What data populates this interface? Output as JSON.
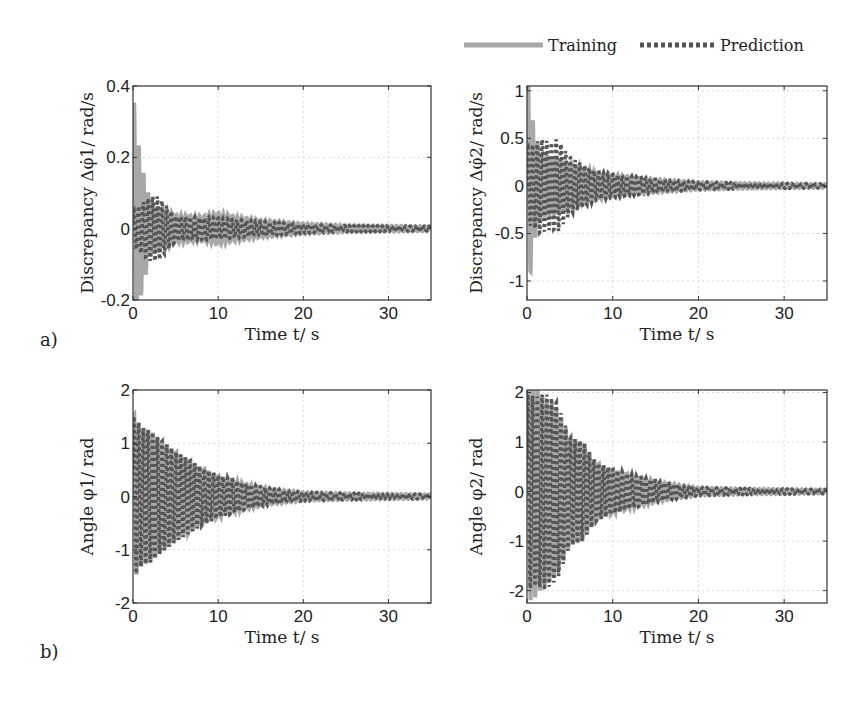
{
  "legend": {
    "items": [
      {
        "name": "Training",
        "style": "solid",
        "color": "#a8a8a8"
      },
      {
        "name": "Prediction",
        "style": "dotted",
        "color": "#555555"
      }
    ]
  },
  "panels": [
    {
      "label": "a)"
    },
    {
      "label": "b)"
    }
  ],
  "chart_data": [
    {
      "type": "line",
      "id": "top-left",
      "panel": "a)",
      "title": "",
      "xlabel": "Time t/ s",
      "ylabel": "Discrepancy Δφ̇1/ rad/s",
      "xlim": [
        0,
        35
      ],
      "ylim": [
        -0.2,
        0.4
      ],
      "xticks": [
        0,
        10,
        20,
        30
      ],
      "yticks": [
        -0.2,
        0,
        0.2,
        0.4
      ],
      "ytick_labels": [
        "-0.2",
        "0",
        "0.2",
        "0.4"
      ],
      "grid": true,
      "series": [
        {
          "name": "Training",
          "envelope": {
            "t": [
              0,
              0.3,
              1,
              2,
              3,
              5,
              8,
              10,
              12,
              15,
              20,
              25,
              35
            ],
            "amp": [
              0.4,
              0.3,
              0.18,
              0.08,
              0.06,
              0.04,
              0.035,
              0.045,
              0.035,
              0.025,
              0.015,
              0.01,
              0.007
            ]
          }
        },
        {
          "name": "Prediction",
          "envelope": {
            "t": [
              0,
              1,
              2,
              3,
              5,
              8,
              10,
              12,
              15,
              20,
              25,
              35
            ],
            "amp": [
              0.05,
              0.07,
              0.09,
              0.09,
              0.035,
              0.03,
              0.03,
              0.025,
              0.02,
              0.012,
              0.008,
              0.006
            ]
          }
        }
      ]
    },
    {
      "type": "line",
      "id": "top-right",
      "panel": "a)",
      "title": "",
      "xlabel": "Time t/ s",
      "ylabel": "Discrepancy Δφ̇2/ rad/s",
      "xlim": [
        0,
        35
      ],
      "ylim": [
        -1.2,
        1.05
      ],
      "xticks": [
        0,
        10,
        20,
        30
      ],
      "yticks": [
        -1,
        -0.5,
        0,
        0.5,
        1
      ],
      "ytick_labels": [
        "-1",
        "-0.5",
        "0",
        "0.5",
        "1"
      ],
      "grid": true,
      "series": [
        {
          "name": "Training",
          "envelope": {
            "t": [
              0,
              0.3,
              0.8,
              1.5,
              3,
              5,
              8,
              10,
              15,
              20,
              25,
              35
            ],
            "amp": [
              1.2,
              1.0,
              0.6,
              0.35,
              0.3,
              0.25,
              0.15,
              0.12,
              0.07,
              0.04,
              0.03,
              0.02
            ]
          }
        },
        {
          "name": "Prediction",
          "envelope": {
            "t": [
              0,
              1,
              1.5,
              3,
              3.5,
              5,
              8,
              10,
              15,
              20,
              25,
              35
            ],
            "amp": [
              0.4,
              0.45,
              0.5,
              0.45,
              0.5,
              0.3,
              0.15,
              0.12,
              0.07,
              0.04,
              0.03,
              0.02
            ]
          }
        }
      ]
    },
    {
      "type": "line",
      "id": "bottom-left",
      "panel": "b)",
      "title": "",
      "xlabel": "Time t/ s",
      "ylabel": "Angle φ1/ rad",
      "xlim": [
        0,
        35
      ],
      "ylim": [
        -2,
        2
      ],
      "xticks": [
        0,
        10,
        20,
        30
      ],
      "yticks": [
        -2,
        -1,
        0,
        1,
        2
      ],
      "ytick_labels": [
        "-2",
        "-1",
        "0",
        "1",
        "2"
      ],
      "grid": true,
      "series": [
        {
          "name": "Training",
          "envelope": {
            "t": [
              0,
              1,
              2,
              3,
              5,
              8,
              10,
              13,
              16,
              20,
              25,
              35
            ],
            "amp": [
              1.6,
              1.3,
              1.25,
              1.1,
              0.85,
              0.55,
              0.4,
              0.25,
              0.15,
              0.08,
              0.06,
              0.04
            ]
          }
        },
        {
          "name": "Prediction",
          "envelope": {
            "t": [
              0,
              1,
              2,
              3,
              5,
              8,
              10,
              13,
              16,
              20,
              25,
              35
            ],
            "amp": [
              1.55,
              1.3,
              1.25,
              1.1,
              0.85,
              0.55,
              0.4,
              0.25,
              0.15,
              0.08,
              0.06,
              0.04
            ]
          }
        }
      ]
    },
    {
      "type": "line",
      "id": "bottom-right",
      "panel": "b)",
      "title": "",
      "xlabel": "Time t/ s",
      "ylabel": "Angle φ2/ rad",
      "xlim": [
        0,
        35
      ],
      "ylim": [
        -2.25,
        2.05
      ],
      "xticks": [
        0,
        10,
        20,
        30
      ],
      "yticks": [
        -2,
        -1,
        0,
        1,
        2
      ],
      "ytick_labels": [
        "-2",
        "-1",
        "0",
        "1",
        "2"
      ],
      "grid": true,
      "series": [
        {
          "name": "Training",
          "envelope": {
            "t": [
              0,
              0.7,
              2,
              3.5,
              5,
              6.5,
              8,
              10,
              13,
              16,
              20,
              25,
              35
            ],
            "amp": [
              2.2,
              2.2,
              1.9,
              1.7,
              1.1,
              1.0,
              0.6,
              0.45,
              0.3,
              0.18,
              0.08,
              0.06,
              0.04
            ]
          }
        },
        {
          "name": "Prediction",
          "envelope": {
            "t": [
              0,
              1,
              2,
              3.5,
              5,
              6.5,
              8,
              10,
              13,
              16,
              20,
              25,
              35
            ],
            "amp": [
              2.0,
              1.9,
              2.0,
              1.8,
              1.1,
              1.0,
              0.6,
              0.45,
              0.3,
              0.18,
              0.08,
              0.06,
              0.04
            ]
          }
        }
      ]
    }
  ],
  "layout": {
    "plots": [
      {
        "x0": 133,
        "y0": 86,
        "x1": 431,
        "y1": 300
      },
      {
        "x0": 527,
        "y0": 86,
        "x1": 827,
        "y1": 300
      },
      {
        "x0": 133,
        "y0": 390,
        "x1": 431,
        "y1": 603
      },
      {
        "x0": 527,
        "y0": 390,
        "x1": 827,
        "y1": 603
      }
    ],
    "oscillation_period_s": 0.55
  }
}
